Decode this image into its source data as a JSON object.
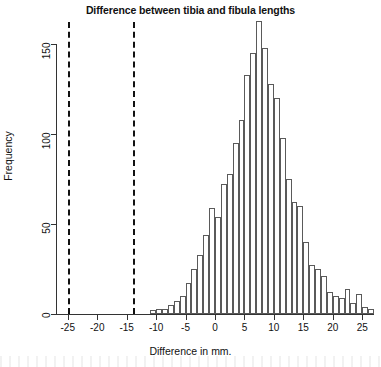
{
  "chart_data": {
    "type": "bar",
    "title": "Difference between tibia and fibula lengths",
    "xlabel": "Difference in mm.",
    "ylabel": "Frequency",
    "xlim": [
      -27,
      27
    ],
    "ylim": [
      0,
      170
    ],
    "xticks": [
      -25,
      -20,
      -15,
      -10,
      -5,
      0,
      5,
      10,
      15,
      20,
      25
    ],
    "xtick_labels": [
      "-25",
      "-20",
      "-15",
      "-10",
      "-5",
      "0",
      "5",
      "10",
      "15",
      "20",
      "25"
    ],
    "yticks": [
      0,
      50,
      100,
      150
    ],
    "ytick_labels": [
      "0",
      "50",
      "100",
      "150"
    ],
    "grid": false,
    "legend": "none",
    "bin_width": 1,
    "bin_starts": [
      -11,
      -10,
      -9,
      -8,
      -7,
      -6,
      -5,
      -4,
      -3,
      -2,
      -1,
      0,
      1,
      2,
      3,
      4,
      5,
      6,
      7,
      8,
      9,
      10,
      11,
      12,
      13,
      14,
      15,
      16,
      17,
      18,
      19,
      20,
      21,
      22,
      23,
      24,
      25,
      26
    ],
    "categories": [
      "-11",
      "-10",
      "-9",
      "-8",
      "-7",
      "-6",
      "-5",
      "-4",
      "-3",
      "-2",
      "-1",
      "0",
      "1",
      "2",
      "3",
      "4",
      "5",
      "6",
      "7",
      "8",
      "9",
      "10",
      "11",
      "12",
      "13",
      "14",
      "15",
      "16",
      "17",
      "18",
      "19",
      "20",
      "21",
      "22",
      "23",
      "24",
      "25",
      "26"
    ],
    "values": [
      2,
      3,
      3,
      5,
      7,
      10,
      17,
      25,
      33,
      44,
      59,
      54,
      72,
      78,
      95,
      108,
      133,
      145,
      163,
      148,
      128,
      120,
      98,
      75,
      62,
      60,
      40,
      27,
      25,
      21,
      12,
      10,
      9,
      14,
      6,
      11,
      4,
      3
    ],
    "annotations": [
      {
        "name": "reference-line-left",
        "type": "vline",
        "x": -25,
        "style": "dashed",
        "color": "#111111"
      },
      {
        "name": "reference-line-right",
        "type": "vline",
        "x": -14,
        "style": "dashed",
        "color": "#111111"
      }
    ]
  }
}
